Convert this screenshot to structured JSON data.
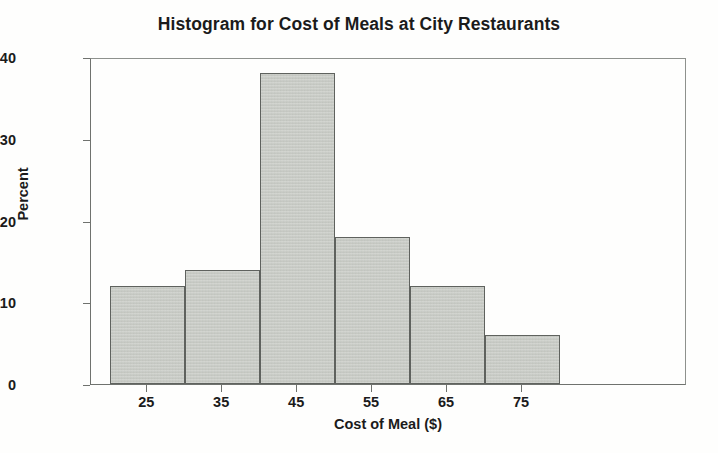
{
  "chart_data": {
    "type": "bar",
    "title": "Histogram for Cost of Meals at City Restaurants",
    "xlabel": "Cost of Meal ($)",
    "ylabel": "Percent",
    "categories": [
      "20-30",
      "30-40",
      "40-50",
      "50-60",
      "60-70",
      "70-80"
    ],
    "bin_edges": [
      20,
      30,
      40,
      50,
      60,
      70,
      80
    ],
    "values": [
      12,
      14,
      38,
      18,
      12,
      6
    ],
    "x_ticks": [
      25,
      35,
      45,
      55,
      65,
      75
    ],
    "x_tick_labels": [
      "25",
      "35",
      "45",
      "55",
      "65",
      "75"
    ],
    "y_ticks": [
      0,
      10,
      20,
      30,
      40
    ],
    "y_tick_labels": [
      "0",
      "10",
      "20",
      "30",
      "40"
    ],
    "xlim": [
      17.5,
      97.0
    ],
    "ylim": [
      0,
      40
    ],
    "grid": false,
    "legend": false,
    "bar_fill_color": "#c9ccc6",
    "bar_edge_color": "#5f625e",
    "axis_color": "#6f726e",
    "text_color": "#1b1b1b",
    "background_color": "#fefefd"
  }
}
